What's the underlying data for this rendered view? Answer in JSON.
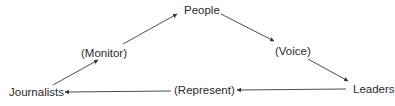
{
  "diagram": {
    "nodes": {
      "people": "People",
      "journalists": "Journalists",
      "leaders": "Leaders"
    },
    "edges": {
      "monitor": "(Monitor)",
      "voice": "(Voice)",
      "represent": "(Represent)"
    },
    "colors": {
      "line": "#3a3a3a",
      "text": "#2a2a2a"
    }
  }
}
